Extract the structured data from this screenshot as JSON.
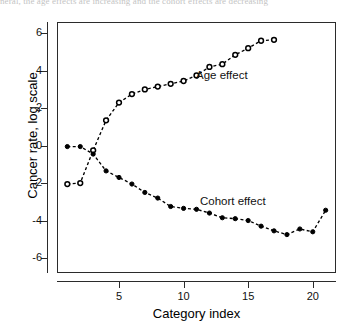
{
  "page": {
    "cropped_body_text": "neral, the age effects are increasing and the cohort effects are decreasing"
  },
  "chart_data": {
    "type": "line",
    "title": "",
    "subtitle": "",
    "xlabel": "Category index",
    "ylabel": "Cancer rate, log scale",
    "xlim": [
      0.2,
      21.8
    ],
    "ylim": [
      -6.8,
      6.6
    ],
    "xticks": [
      5,
      10,
      15,
      20
    ],
    "xticklabels": [
      "5",
      "10",
      "15",
      "20"
    ],
    "yticks": [
      6,
      4,
      2,
      0,
      -2,
      -4,
      -6
    ],
    "yticklabels": [
      "6",
      "4",
      "2",
      "0",
      "-2",
      "-4",
      "-6"
    ],
    "grid": false,
    "legend_position": "inline-annotations",
    "marker_size": 4.2,
    "line_style": "dashed",
    "line_color": "#000000",
    "series": [
      {
        "name": "Age effect",
        "marker": "open-circle",
        "fill": "#ffffff",
        "stroke": "#000000",
        "x": [
          1,
          2,
          3,
          4,
          5,
          6,
          7,
          8,
          9,
          10,
          11,
          12,
          13,
          14,
          15,
          16,
          17
        ],
        "values": [
          -2.05,
          -2.0,
          -0.25,
          1.35,
          2.3,
          2.75,
          3.0,
          3.15,
          3.3,
          3.45,
          3.75,
          4.2,
          4.35,
          4.85,
          5.2,
          5.6,
          5.65
        ]
      },
      {
        "name": "Cohort effect",
        "marker": "filled-circle",
        "fill": "#000000",
        "stroke": "#000000",
        "x": [
          1,
          2,
          3,
          4,
          5,
          6,
          7,
          8,
          9,
          10,
          11,
          12,
          13,
          14,
          15,
          16,
          17,
          18,
          19,
          20,
          21
        ],
        "values": [
          -0.05,
          -0.05,
          -0.45,
          -1.35,
          -1.7,
          -2.05,
          -2.5,
          -2.8,
          -3.25,
          -3.35,
          -3.4,
          -3.6,
          -3.85,
          -3.9,
          -4.0,
          -4.3,
          -4.55,
          -4.75,
          -4.45,
          -4.6,
          -3.45
        ]
      }
    ],
    "annotations": [
      {
        "text": "Age effect",
        "x": 14.2,
        "y": 3.2
      },
      {
        "text": "Cohort effect",
        "x": 14.4,
        "y": -3.1
      }
    ]
  }
}
